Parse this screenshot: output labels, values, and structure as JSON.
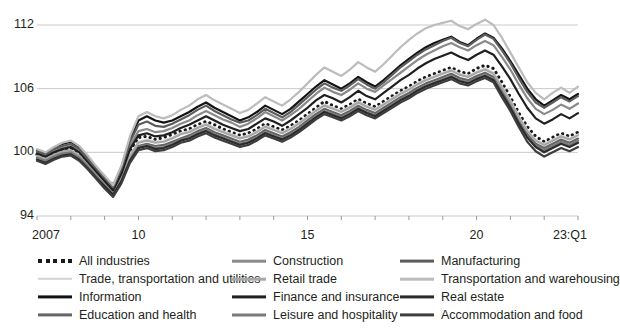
{
  "chart_data": {
    "type": "line",
    "title": "",
    "subtitle": "",
    "xlabel": "",
    "ylabel": "",
    "ylim": [
      94,
      114
    ],
    "yticks": [
      94,
      100,
      106,
      112
    ],
    "ytick_labels": [
      "94",
      "100",
      "106",
      "112"
    ],
    "grid": true,
    "legend_position": "bottom",
    "x_start_year": 2007,
    "x_end_label": "23:Q1",
    "x_quarters": 65,
    "xtick_labels": [
      "2007",
      "10",
      "15",
      "20",
      "23:Q1"
    ],
    "xtick_positions": [
      0,
      12,
      32,
      52,
      64
    ],
    "series": [
      {
        "name": "All industries",
        "color": "#1a1a1a",
        "style": "dotted",
        "width": 2.6,
        "values": [
          99.8,
          99.5,
          99.9,
          100.2,
          100.4,
          100.0,
          99.2,
          98.4,
          97.6,
          96.9,
          98.2,
          100.1,
          101.4,
          101.5,
          101.2,
          101.4,
          101.7,
          102.0,
          102.2,
          102.6,
          102.9,
          102.6,
          102.2,
          101.9,
          101.6,
          101.8,
          102.2,
          102.7,
          102.4,
          102.1,
          102.5,
          103.0,
          103.6,
          104.2,
          104.8,
          104.4,
          104.1,
          104.5,
          105.0,
          104.6,
          104.3,
          104.8,
          105.3,
          105.8,
          106.2,
          106.7,
          107.1,
          107.4,
          107.7,
          108.0,
          107.6,
          107.4,
          107.9,
          108.2,
          107.9,
          106.6,
          105.2,
          103.7,
          102.4,
          101.5,
          101.0,
          101.4,
          101.8,
          101.5,
          101.9
        ]
      },
      {
        "name": "Trade, transportation and utilities",
        "color": "#d4d4d4",
        "style": "solid",
        "width": 2.0,
        "values": [
          99.6,
          99.3,
          99.7,
          100.0,
          100.1,
          99.6,
          98.9,
          98.0,
          97.2,
          96.4,
          97.8,
          99.8,
          101.0,
          101.2,
          101.0,
          101.1,
          101.4,
          101.8,
          102.0,
          102.4,
          102.7,
          102.3,
          102.0,
          101.7,
          101.4,
          101.6,
          102.0,
          102.5,
          102.2,
          101.9,
          102.3,
          102.8,
          103.4,
          104.0,
          104.5,
          104.2,
          103.9,
          104.3,
          104.8,
          104.4,
          104.1,
          104.6,
          105.1,
          105.6,
          106.0,
          106.5,
          106.9,
          107.2,
          107.5,
          107.8,
          107.4,
          107.2,
          107.6,
          107.9,
          107.5,
          106.2,
          104.9,
          103.4,
          102.1,
          101.2,
          100.8,
          101.2,
          101.6,
          101.3,
          101.7
        ]
      },
      {
        "name": "Information",
        "color": "#141414",
        "style": "solid",
        "width": 2.2,
        "values": [
          100.2,
          99.9,
          100.4,
          100.8,
          101.0,
          100.5,
          99.6,
          98.6,
          97.7,
          96.8,
          98.6,
          101.2,
          103.0,
          103.4,
          103.0,
          102.8,
          103.0,
          103.4,
          103.8,
          104.3,
          104.7,
          104.2,
          103.8,
          103.4,
          103.0,
          103.3,
          103.8,
          104.4,
          104.0,
          103.6,
          104.1,
          104.8,
          105.5,
          106.2,
          106.8,
          106.4,
          106.0,
          106.5,
          107.1,
          106.6,
          106.2,
          106.8,
          107.5,
          108.2,
          108.8,
          109.4,
          109.9,
          110.3,
          110.6,
          110.9,
          110.4,
          110.1,
          110.7,
          111.2,
          110.8,
          109.8,
          108.6,
          107.3,
          106.0,
          105.0,
          104.4,
          104.9,
          105.4,
          105.0,
          105.5
        ]
      },
      {
        "name": "Education and health",
        "color": "#666666",
        "style": "solid",
        "width": 2.2,
        "values": [
          99.4,
          99.1,
          99.5,
          99.8,
          99.9,
          99.4,
          98.6,
          97.7,
          96.9,
          96.1,
          97.5,
          99.4,
          100.6,
          100.8,
          100.6,
          100.7,
          101.0,
          101.3,
          101.6,
          102.0,
          102.3,
          101.9,
          101.6,
          101.3,
          101.0,
          101.2,
          101.6,
          102.1,
          101.8,
          101.5,
          101.9,
          102.4,
          103.0,
          103.6,
          104.1,
          103.8,
          103.5,
          103.9,
          104.4,
          104.0,
          103.7,
          104.2,
          104.7,
          105.2,
          105.6,
          106.1,
          106.5,
          106.8,
          107.1,
          107.4,
          107.0,
          106.8,
          107.2,
          107.5,
          107.1,
          105.8,
          104.5,
          103.0,
          101.7,
          100.8,
          100.4,
          100.8,
          101.2,
          100.9,
          101.3
        ]
      },
      {
        "name": "Construction",
        "color": "#8a8a8a",
        "style": "solid",
        "width": 2.2,
        "values": [
          100.0,
          99.7,
          100.1,
          100.4,
          100.6,
          100.1,
          99.3,
          98.4,
          97.5,
          96.6,
          98.3,
          100.6,
          102.0,
          102.2,
          101.9,
          102.0,
          102.3,
          102.7,
          103.0,
          103.5,
          103.9,
          103.5,
          103.1,
          102.8,
          102.4,
          102.7,
          103.2,
          103.8,
          103.4,
          103.0,
          103.5,
          104.1,
          104.8,
          105.5,
          106.1,
          105.7,
          105.4,
          105.9,
          106.5,
          106.0,
          105.7,
          106.3,
          106.9,
          107.5,
          108.1,
          108.7,
          109.2,
          109.6,
          110.0,
          110.3,
          109.9,
          109.6,
          110.1,
          110.5,
          110.1,
          109.0,
          107.8,
          106.4,
          105.1,
          104.1,
          103.6,
          104.0,
          104.5,
          104.1,
          104.6
        ]
      },
      {
        "name": "Retail trade",
        "color": "#a8a8a8",
        "style": "solid",
        "width": 2.2,
        "values": [
          99.7,
          99.4,
          99.8,
          100.1,
          100.2,
          99.7,
          98.9,
          98.0,
          97.1,
          96.3,
          97.7,
          99.7,
          100.9,
          101.1,
          100.9,
          101.0,
          101.3,
          101.7,
          101.9,
          102.3,
          102.6,
          102.2,
          101.9,
          101.6,
          101.3,
          101.5,
          101.9,
          102.4,
          102.1,
          101.8,
          102.2,
          102.7,
          103.3,
          103.9,
          104.4,
          104.1,
          103.8,
          104.2,
          104.7,
          104.3,
          104.0,
          104.5,
          105.0,
          105.5,
          105.9,
          106.4,
          106.8,
          107.1,
          107.4,
          107.7,
          107.3,
          107.1,
          107.5,
          107.8,
          107.4,
          106.1,
          104.8,
          103.3,
          102.0,
          101.1,
          100.7,
          101.1,
          101.5,
          101.2,
          101.6
        ]
      },
      {
        "name": "Finance and insurance",
        "color": "#1f1f1f",
        "style": "solid",
        "width": 2.2,
        "values": [
          99.9,
          99.6,
          100.0,
          100.3,
          100.5,
          100.0,
          99.1,
          98.2,
          97.3,
          96.4,
          98.0,
          100.3,
          101.6,
          101.8,
          101.5,
          101.6,
          101.9,
          102.3,
          102.6,
          103.0,
          103.4,
          103.0,
          102.6,
          102.3,
          102.0,
          102.2,
          102.7,
          103.2,
          102.9,
          102.5,
          103.0,
          103.6,
          104.2,
          104.9,
          105.4,
          105.1,
          104.7,
          105.2,
          105.8,
          105.3,
          105.0,
          105.6,
          106.2,
          106.8,
          107.3,
          107.9,
          108.4,
          108.8,
          109.1,
          109.4,
          109.0,
          108.7,
          109.2,
          109.6,
          109.2,
          108.1,
          106.9,
          105.5,
          104.2,
          103.2,
          102.7,
          103.1,
          103.6,
          103.2,
          103.7
        ]
      },
      {
        "name": "Leisure and hospitality",
        "color": "#7a7a7a",
        "style": "solid",
        "width": 2.2,
        "values": [
          99.5,
          99.2,
          99.6,
          99.9,
          100.0,
          99.5,
          98.7,
          97.8,
          96.9,
          96.0,
          97.4,
          99.3,
          100.5,
          100.7,
          100.4,
          100.5,
          100.8,
          101.2,
          101.4,
          101.8,
          102.1,
          101.7,
          101.4,
          101.1,
          100.8,
          101.0,
          101.4,
          101.9,
          101.6,
          101.3,
          101.7,
          102.2,
          102.8,
          103.4,
          103.9,
          103.6,
          103.3,
          103.7,
          104.2,
          103.8,
          103.5,
          104.0,
          104.5,
          105.0,
          105.4,
          105.9,
          106.3,
          106.6,
          106.9,
          107.2,
          106.8,
          106.6,
          107.0,
          107.3,
          106.9,
          105.6,
          104.3,
          102.8,
          101.5,
          100.6,
          100.2,
          100.6,
          101.0,
          100.7,
          101.1
        ]
      },
      {
        "name": "Manufacturing",
        "color": "#5c5c5c",
        "style": "solid",
        "width": 2.2,
        "values": [
          100.1,
          99.8,
          100.3,
          100.6,
          100.8,
          100.3,
          99.4,
          98.5,
          97.6,
          96.7,
          98.5,
          101.0,
          102.6,
          102.9,
          102.5,
          102.4,
          102.7,
          103.1,
          103.5,
          104.0,
          104.4,
          103.9,
          103.5,
          103.1,
          102.8,
          103.0,
          103.5,
          104.1,
          103.7,
          103.3,
          103.8,
          104.5,
          105.2,
          105.9,
          106.5,
          106.1,
          105.8,
          106.3,
          106.9,
          106.4,
          106.0,
          106.6,
          107.3,
          108.0,
          108.6,
          109.2,
          109.7,
          110.1,
          110.5,
          110.8,
          110.3,
          110.0,
          110.6,
          111.1,
          110.7,
          109.6,
          108.4,
          107.0,
          105.7,
          104.7,
          104.2,
          104.7,
          105.2,
          104.8,
          105.3
        ]
      },
      {
        "name": "Transportation and warehousing",
        "color": "#bcbcbc",
        "style": "solid",
        "width": 2.2,
        "values": [
          100.3,
          100.0,
          100.5,
          100.9,
          101.1,
          100.6,
          99.7,
          98.7,
          97.8,
          96.9,
          98.8,
          101.5,
          103.4,
          103.8,
          103.4,
          103.2,
          103.5,
          104.0,
          104.4,
          105.0,
          105.4,
          104.9,
          104.5,
          104.1,
          103.7,
          104.0,
          104.6,
          105.2,
          104.8,
          104.4,
          105.0,
          105.7,
          106.5,
          107.3,
          108.0,
          107.6,
          107.2,
          107.8,
          108.5,
          108.0,
          107.6,
          108.3,
          109.1,
          109.9,
          110.6,
          111.2,
          111.7,
          112.0,
          112.2,
          112.4,
          111.9,
          111.6,
          112.1,
          112.5,
          112.0,
          110.8,
          109.4,
          108.0,
          106.6,
          105.6,
          105.0,
          105.6,
          106.1,
          105.6,
          106.2
        ]
      },
      {
        "name": "Real estate",
        "color": "#2b2b2b",
        "style": "solid",
        "width": 2.2,
        "values": [
          99.3,
          99.0,
          99.4,
          99.7,
          99.8,
          99.3,
          98.5,
          97.6,
          96.8,
          96.0,
          97.3,
          99.2,
          100.4,
          100.6,
          100.3,
          100.4,
          100.7,
          101.1,
          101.3,
          101.7,
          102.0,
          101.6,
          101.3,
          101.0,
          100.7,
          100.9,
          101.3,
          101.8,
          101.5,
          101.2,
          101.6,
          102.1,
          102.7,
          103.3,
          103.8,
          103.5,
          103.2,
          103.6,
          104.1,
          103.7,
          103.4,
          103.9,
          104.4,
          104.9,
          105.3,
          105.8,
          106.2,
          106.5,
          106.8,
          107.1,
          106.7,
          106.5,
          106.9,
          107.2,
          106.8,
          105.5,
          104.2,
          102.7,
          101.4,
          100.5,
          100.0,
          100.4,
          100.8,
          100.5,
          100.9
        ]
      },
      {
        "name": "Accommodation and food",
        "color": "#3d3d3d",
        "style": "solid",
        "width": 2.2,
        "values": [
          99.2,
          98.9,
          99.3,
          99.6,
          99.7,
          99.2,
          98.4,
          97.5,
          96.6,
          95.8,
          97.1,
          99.0,
          100.2,
          100.4,
          100.1,
          100.2,
          100.5,
          100.9,
          101.1,
          101.5,
          101.8,
          101.4,
          101.1,
          100.8,
          100.5,
          100.7,
          101.1,
          101.6,
          101.3,
          101.0,
          101.4,
          101.9,
          102.5,
          103.1,
          103.6,
          103.3,
          103.0,
          103.4,
          103.9,
          103.5,
          103.2,
          103.7,
          104.2,
          104.7,
          105.1,
          105.6,
          106.0,
          106.3,
          106.6,
          106.9,
          106.5,
          106.3,
          106.7,
          107.0,
          106.6,
          105.2,
          103.9,
          102.4,
          101.0,
          100.1,
          99.6,
          100.0,
          100.4,
          100.1,
          100.5
        ]
      }
    ]
  },
  "legend": {
    "columns": [
      {
        "items": [
          {
            "label": "All industries",
            "color": "#1a1a1a",
            "style": "dotted",
            "width": 2.6
          },
          {
            "label": "Trade, transportation and utilities",
            "color": "#d4d4d4",
            "style": "solid",
            "width": 2.4
          },
          {
            "label": "Information",
            "color": "#141414",
            "style": "solid",
            "width": 3.2
          },
          {
            "label": "Education and health",
            "color": "#666666",
            "style": "solid",
            "width": 3.2
          }
        ]
      },
      {
        "items": [
          {
            "label": "Construction",
            "color": "#8a8a8a",
            "style": "solid",
            "width": 2.6
          },
          {
            "label": "Retail trade",
            "color": "#a8a8a8",
            "style": "solid",
            "width": 2.6
          },
          {
            "label": "Finance and insurance",
            "color": "#1f1f1f",
            "style": "solid",
            "width": 3.2
          },
          {
            "label": "Leisure and hospitality",
            "color": "#7a7a7a",
            "style": "solid",
            "width": 3.0
          }
        ]
      },
      {
        "items": [
          {
            "label": "Manufacturing",
            "color": "#5c5c5c",
            "style": "solid",
            "width": 2.8
          },
          {
            "label": "Transportation and warehousing",
            "color": "#bcbcbc",
            "style": "solid",
            "width": 2.6
          },
          {
            "label": "Real estate",
            "color": "#2b2b2b",
            "style": "solid",
            "width": 3.2
          },
          {
            "label": "Accommodation and food",
            "color": "#3d3d3d",
            "style": "solid",
            "width": 3.2
          }
        ]
      }
    ]
  },
  "axis": {
    "gridline_color": "#c9c9c9",
    "axis_color": "#9a9a9a",
    "text_color": "#231f20"
  }
}
